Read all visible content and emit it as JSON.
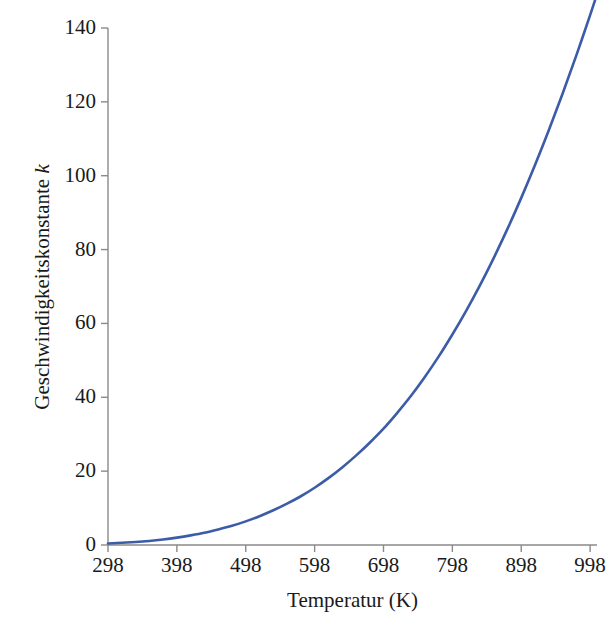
{
  "chart_data": {
    "type": "line",
    "title": "",
    "xlabel": "Temperatur (K)",
    "ylabel_plain": "Geschwindigkeitskonstante k",
    "ylabel_prefix": "Geschwindigkeitskonstante ",
    "ylabel_symbol": "k",
    "xlim": [
      298,
      1008
    ],
    "ylim": [
      0,
      140
    ],
    "xticks": [
      298,
      398,
      498,
      598,
      698,
      798,
      898,
      998
    ],
    "xtick_labels": [
      "298",
      "398",
      "498",
      "598",
      "698",
      "798",
      "898",
      "998"
    ],
    "yticks": [
      0,
      20,
      40,
      60,
      80,
      100,
      120,
      140
    ],
    "ytick_labels": [
      "0",
      "20",
      "40",
      "60",
      "80",
      "100",
      "120",
      "140"
    ],
    "grid": false,
    "legend": false,
    "series": [
      {
        "name": "k(T)",
        "color": "#3c5ca8",
        "line_width": 2.6,
        "x": [
          298,
          318,
          338,
          358,
          378,
          398,
          418,
          438,
          458,
          478,
          498,
          518,
          538,
          558,
          578,
          598,
          618,
          638,
          658,
          678,
          698,
          718,
          738,
          758,
          778,
          798,
          818,
          838,
          858,
          878,
          898,
          918,
          938,
          958,
          978,
          998,
          1006
        ],
        "values": [
          0.4,
          0.6,
          0.8,
          1.1,
          1.5,
          2.0,
          2.6,
          3.3,
          4.2,
          5.2,
          6.4,
          7.8,
          9.4,
          11.2,
          13.2,
          15.5,
          18.1,
          21.0,
          24.2,
          27.7,
          31.5,
          35.8,
          40.4,
          45.5,
          51.0,
          57.0,
          63.4,
          70.3,
          77.7,
          85.6,
          94.0,
          102.9,
          112.3,
          122.2,
          132.6,
          143.5,
          148.0
        ]
      }
    ],
    "annotations": [],
    "background_color": "#ffffff",
    "axis_color": "#8a8a8a",
    "text_color": "#1a1a1a"
  },
  "axes_geometry": {
    "plot_left": 108,
    "plot_right": 597,
    "plot_bottom": 545,
    "plot_top": 28
  }
}
